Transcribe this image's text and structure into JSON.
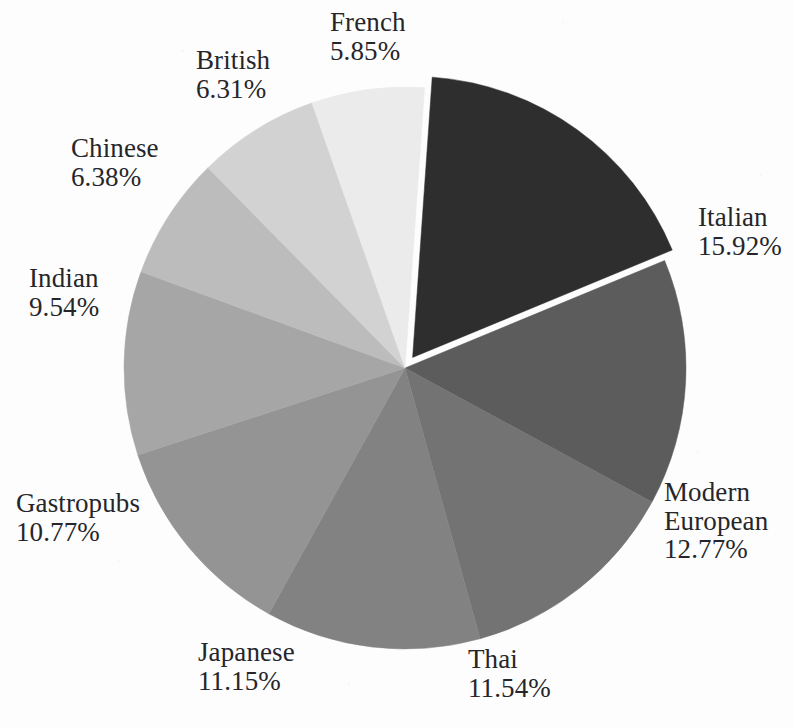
{
  "chart_data": {
    "type": "pie",
    "title": "",
    "subtitle": "",
    "xlabel": "",
    "ylabel": "",
    "legend_position": "none",
    "grid": false,
    "value_suffix": "%",
    "center": {
      "x": 405,
      "y": 368
    },
    "radius": 281,
    "start_angle_deg": -86,
    "direction": "clockwise",
    "exploded_slice": "Italian",
    "explode_offset_px": 13,
    "categories": [
      "Italian",
      "Modern European",
      "Thai",
      "Japanese",
      "Gastropubs",
      "Indian",
      "Chinese",
      "British",
      "French"
    ],
    "values": [
      15.92,
      12.77,
      11.54,
      11.15,
      10.77,
      9.54,
      6.38,
      6.31,
      5.85
    ],
    "colors": [
      "#2e2e2e",
      "#5c5c5c",
      "#737373",
      "#828282",
      "#949494",
      "#a6a6a6",
      "#bcbcbc",
      "#d2d2d2",
      "#ebebeb"
    ],
    "slices": [
      {
        "name": "Italian",
        "value": 15.92,
        "value_text": "15.92%",
        "color": "#2e2e2e",
        "exploded": true,
        "label_lines": [
          "Italian",
          "15.92%"
        ],
        "label_align": "left",
        "label_x": 698,
        "label_y": 203
      },
      {
        "name": "Modern European",
        "value": 12.77,
        "value_text": "12.77%",
        "color": "#5c5c5c",
        "exploded": false,
        "label_lines": [
          "Modern",
          "European",
          "12.77%"
        ],
        "label_align": "left",
        "label_x": 664,
        "label_y": 478
      },
      {
        "name": "Thai",
        "value": 11.54,
        "value_text": "11.54%",
        "color": "#737373",
        "exploded": false,
        "label_lines": [
          "Thai",
          "11.54%"
        ],
        "label_align": "left",
        "label_x": 468,
        "label_y": 645
      },
      {
        "name": "Japanese",
        "value": 11.15,
        "value_text": "11.15%",
        "color": "#828282",
        "exploded": false,
        "label_lines": [
          "Japanese",
          "11.15%"
        ],
        "label_align": "left",
        "label_x": 198,
        "label_y": 638
      },
      {
        "name": "Gastropubs",
        "value": 10.77,
        "value_text": "10.77%",
        "color": "#949494",
        "exploded": false,
        "label_lines": [
          "Gastropubs",
          "10.77%"
        ],
        "label_align": "left",
        "label_x": 16,
        "label_y": 489
      },
      {
        "name": "Indian",
        "value": 9.54,
        "value_text": "9.54%",
        "color": "#a6a6a6",
        "exploded": false,
        "label_lines": [
          "Indian",
          "9.54%"
        ],
        "label_align": "left",
        "label_x": 29,
        "label_y": 264
      },
      {
        "name": "Chinese",
        "value": 6.38,
        "value_text": "6.38%",
        "color": "#bcbcbc",
        "exploded": false,
        "label_lines": [
          "Chinese",
          "6.38%"
        ],
        "label_align": "left",
        "label_x": 71,
        "label_y": 134
      },
      {
        "name": "British",
        "value": 6.31,
        "value_text": "6.31%",
        "color": "#d2d2d2",
        "exploded": false,
        "label_lines": [
          "British",
          "6.31%"
        ],
        "label_align": "left",
        "label_x": 196,
        "label_y": 46
      },
      {
        "name": "French",
        "value": 5.85,
        "value_text": "5.85%",
        "color": "#ebebeb",
        "exploded": false,
        "label_lines": [
          "French",
          "5.85%"
        ],
        "label_align": "left",
        "label_x": 330,
        "label_y": 8
      }
    ]
  },
  "page": {
    "background_color": "#fdfdfd",
    "text_color": "#26262a"
  }
}
